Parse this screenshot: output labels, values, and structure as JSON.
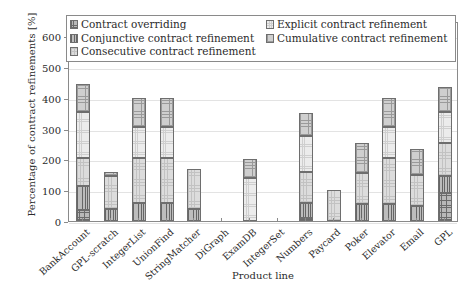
{
  "chart_data": {
    "type": "bar",
    "stacked": true,
    "title": "",
    "xlabel": "Product line",
    "ylabel": "Percentage of contract refinements [%]",
    "ylim": [
      0,
      650
    ],
    "yticks": [
      0,
      100,
      200,
      300,
      400,
      500,
      600
    ],
    "grid": true,
    "legend_position": "top-inside",
    "categories": [
      "BankAccount",
      "GPL-scratch",
      "IntegerList",
      "UnionFind",
      "StringMatcher",
      "DiGraph",
      "ExamDB",
      "IntegerSet",
      "Numbers",
      "Paycard",
      "Poker",
      "Elevator",
      "Email",
      "GPL"
    ],
    "series": [
      {
        "name": "Contract overriding",
        "pattern": "dense-dark-grid",
        "values": [
          35,
          0,
          0,
          0,
          0,
          0,
          0,
          0,
          10,
          0,
          0,
          0,
          0,
          90
        ]
      },
      {
        "name": "Conjunctive contract refinement",
        "pattern": "vertical-dark-lines",
        "values": [
          80,
          40,
          60,
          60,
          40,
          0,
          0,
          0,
          50,
          0,
          55,
          55,
          50,
          55
        ]
      },
      {
        "name": "Consecutive contract refinement",
        "pattern": "light-faint-grid",
        "values": [
          90,
          105,
          145,
          145,
          130,
          0,
          0,
          0,
          100,
          100,
          100,
          150,
          100,
          110
        ]
      },
      {
        "name": "Explicit contract refinement",
        "pattern": "very-light-dots",
        "values": [
          150,
          0,
          100,
          100,
          0,
          0,
          140,
          0,
          115,
          0,
          0,
          100,
          0,
          100
        ],
        "note": "lightest fill"
      },
      {
        "name": "Cumulative contract refinement",
        "pattern": "medium-crosshatch",
        "values": [
          90,
          15,
          95,
          95,
          0,
          0,
          60,
          0,
          75,
          0,
          98,
          95,
          85,
          80
        ]
      }
    ],
    "totals": [
      445,
      160,
      400,
      400,
      170,
      0,
      200,
      0,
      350,
      100,
      253,
      400,
      235,
      435
    ]
  },
  "legend": {
    "items": [
      {
        "label": "Contract overriding"
      },
      {
        "label": "Explicit contract refinement"
      },
      {
        "label": "Conjunctive contract refinement"
      },
      {
        "label": "Cumulative contract refinement"
      },
      {
        "label": "Consecutive contract refinement"
      }
    ]
  },
  "colors": {
    "axis": "#8a8a8a",
    "grid": "#e3e3e3",
    "text": "#2b2b2b",
    "segment_border": "#6e6e6e"
  }
}
